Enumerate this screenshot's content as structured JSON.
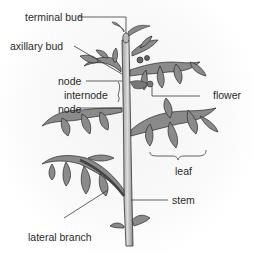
{
  "diagram": {
    "labels": {
      "terminal_bud": "terminal bud",
      "axillary_bud": "axillary bud",
      "node_upper": "node",
      "internode": "internode",
      "node_lower": "node",
      "flower": "flower",
      "leaf": "leaf",
      "stem": "stem",
      "lateral_branch": "lateral branch"
    },
    "colors": {
      "leaf_fill": "#8a8a8a",
      "leaf_outline": "#2a2a2a",
      "stem_fill": "#c8c8c8",
      "leader_line": "#3a3a3a",
      "text": "#2a2a2a"
    }
  }
}
